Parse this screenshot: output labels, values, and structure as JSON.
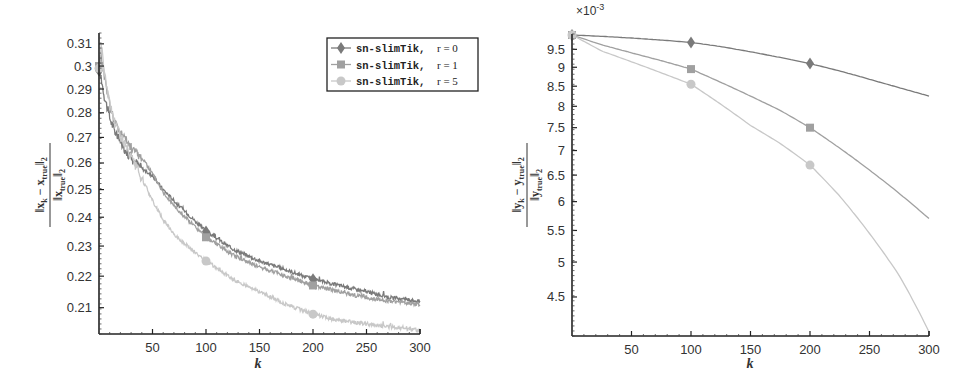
{
  "chart_data": [
    {
      "type": "line",
      "title": "",
      "xlabel": "k",
      "ylabel": "||x_k - x_true||_2 / ||x_true||_2",
      "yscale": "log",
      "xlim": [
        0,
        300
      ],
      "ylim": [
        0.202,
        0.315
      ],
      "xticks": [
        50,
        100,
        150,
        200,
        250,
        300
      ],
      "yticks": [
        0.21,
        0.22,
        0.23,
        0.24,
        0.25,
        0.26,
        0.27,
        0.28,
        0.29,
        0.3,
        0.31
      ],
      "ytick_labels": [
        "0.21",
        "0.22",
        "0.23",
        "0.24",
        "0.25",
        "0.26",
        "0.27",
        "0.28",
        "0.29",
        "0.3",
        "0.31"
      ],
      "grid": false,
      "legend_position": "upper right",
      "x": [
        0,
        2,
        5,
        10,
        15,
        20,
        30,
        40,
        50,
        60,
        75,
        100,
        125,
        150,
        175,
        200,
        225,
        250,
        275,
        300
      ],
      "series": [
        {
          "name": "sn-slimTik, r = 0",
          "marker": "diamond",
          "color": "#7a7a7a",
          "values": [
            0.298,
            0.295,
            0.287,
            0.278,
            0.272,
            0.268,
            0.262,
            0.258,
            0.255,
            0.25,
            0.244,
            0.235,
            0.229,
            0.225,
            0.222,
            0.219,
            0.217,
            0.215,
            0.213,
            0.212
          ]
        },
        {
          "name": "sn-slimTik, r = 1",
          "marker": "square",
          "color": "#a0a0a0",
          "values": [
            0.3,
            0.305,
            0.296,
            0.283,
            0.276,
            0.272,
            0.266,
            0.262,
            0.256,
            0.249,
            0.242,
            0.233,
            0.227,
            0.223,
            0.22,
            0.217,
            0.215,
            0.213,
            0.212,
            0.211
          ]
        },
        {
          "name": "sn-slimTik, r = 5",
          "marker": "circle",
          "color": "#c8c8c8",
          "values": [
            0.299,
            0.31,
            0.297,
            0.284,
            0.276,
            0.271,
            0.262,
            0.254,
            0.246,
            0.239,
            0.232,
            0.225,
            0.219,
            0.215,
            0.211,
            0.208,
            0.206,
            0.205,
            0.204,
            0.203
          ]
        }
      ],
      "markers_at": [
        100,
        200
      ]
    },
    {
      "type": "line",
      "title": "",
      "xlabel": "k",
      "ylabel": "||y_k - y_true||_2 / ||y_true||_2",
      "yscale": "log",
      "y_multiplier": "×10^-3",
      "xlim": [
        0,
        300
      ],
      "ylim": [
        4.0,
        9.95
      ],
      "xticks": [
        50,
        100,
        150,
        200,
        250,
        300
      ],
      "yticks": [
        4.5,
        5,
        5.5,
        6,
        6.5,
        7,
        7.5,
        8,
        8.5,
        9,
        9.5
      ],
      "ytick_labels": [
        "4.5",
        "5",
        "5.5",
        "6",
        "6.5",
        "7",
        "7.5",
        "8",
        "8.5",
        "9",
        "9.5"
      ],
      "grid": false,
      "x": [
        0,
        25,
        50,
        75,
        100,
        125,
        150,
        175,
        200,
        225,
        250,
        275,
        300
      ],
      "series": [
        {
          "name": "sn-slimTik, r = 0",
          "marker": "diamond",
          "color": "#7a7a7a",
          "values": [
            9.92,
            9.88,
            9.83,
            9.77,
            9.7,
            9.58,
            9.43,
            9.27,
            9.1,
            8.9,
            8.68,
            8.46,
            8.25
          ]
        },
        {
          "name": "sn-slimTik, r = 1",
          "marker": "square",
          "color": "#a0a0a0",
          "values": [
            9.92,
            9.63,
            9.4,
            9.18,
            8.95,
            8.6,
            8.25,
            7.9,
            7.5,
            7.05,
            6.6,
            6.15,
            5.7
          ]
        },
        {
          "name": "sn-slimTik, r = 5",
          "marker": "circle",
          "color": "#c8c8c8",
          "values": [
            9.92,
            9.45,
            9.15,
            8.85,
            8.55,
            8.05,
            7.55,
            7.15,
            6.7,
            6.1,
            5.45,
            4.8,
            4.05
          ]
        }
      ],
      "markers_at": [
        100,
        200
      ]
    }
  ],
  "left_panel": {
    "legend": [
      {
        "label": "sn-slimTik, ",
        "math": "r = 0"
      },
      {
        "label": "sn-slimTik, ",
        "math": "r = 1"
      },
      {
        "label": "sn-slimTik, ",
        "math": "r = 5"
      }
    ],
    "xlabel": "k",
    "ylabel_num": "‖x",
    "ylabel_full": "||x_k − x_true||_2 / ||x_true||_2"
  },
  "right_panel": {
    "multiplier": "×10",
    "multiplier_exp": "-3",
    "xlabel": "k",
    "ylabel_full": "||y_k − y_true||_2 / ||y_true||_2"
  }
}
